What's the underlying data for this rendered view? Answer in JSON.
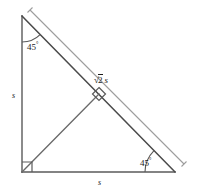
{
  "figure": {
    "type": "geometry-diagram",
    "width": 201,
    "height": 192,
    "colors": {
      "stroke_main": "#4a4a4a",
      "stroke_measure": "#9a9a9a",
      "text": "#1a1a1a",
      "background": "#ffffff"
    }
  },
  "labels": {
    "leg_vertical": "s",
    "leg_horizontal": "s",
    "hypotenuse_prefix": "√",
    "hypotenuse_radicand": "2",
    "hypotenuse_variable": "s",
    "hypotenuse_full": "√2 s",
    "angle_top": "45",
    "angle_top_unit": "°",
    "angle_bottom_right": "45",
    "angle_bottom_right_unit": "°"
  },
  "geometry": {
    "vertices": {
      "apex": [
        22,
        16
      ],
      "bottom_left": [
        22,
        172
      ],
      "bottom_right": [
        175,
        172
      ],
      "hypotenuse_midpoint": [
        99,
        94
      ]
    },
    "measure_line": {
      "start": [
        30,
        10
      ],
      "end": [
        184,
        164
      ],
      "cap_length": 7
    },
    "right_angle_marks": [
      {
        "name": "corner-right-angle",
        "at": [
          22,
          172
        ]
      },
      {
        "name": "altitude-right-angle",
        "at": [
          99,
          94
        ]
      }
    ],
    "angle_arcs": [
      {
        "name": "angle-arc-top",
        "vertex": [
          22,
          16
        ],
        "radius": 26
      },
      {
        "name": "angle-arc-bottom-right",
        "vertex": [
          175,
          172
        ],
        "radius": 30
      }
    ]
  }
}
